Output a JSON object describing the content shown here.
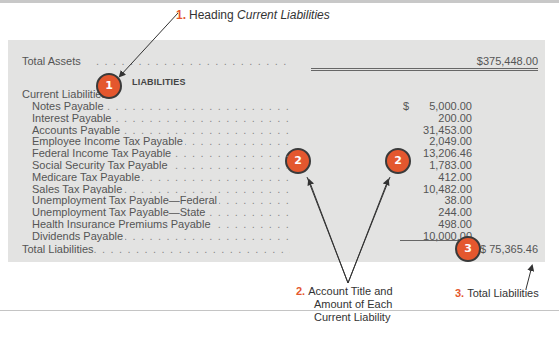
{
  "callouts": {
    "c1": {
      "num": "1.",
      "text": "Heading ",
      "italic": "Current Liabilities"
    },
    "c2": {
      "num": "2.",
      "lines": [
        "Account Title and",
        "Amount of Each",
        "Current Liability"
      ]
    },
    "c3": {
      "num": "3.",
      "text": "Total Liabilities"
    }
  },
  "badges": {
    "b1": "1",
    "b2": "2",
    "b3": "3"
  },
  "colors": {
    "accent": "#e4572e",
    "panel": "#e3e3e2"
  },
  "statement": {
    "total_assets_label": "Total Assets",
    "total_assets_value": "$375,448.00",
    "section_heading": "LIABILITIES",
    "subheading": "Current Liabilities:",
    "items": [
      {
        "label": "Notes Payable",
        "amount": "5,000.00",
        "currency": "$"
      },
      {
        "label": "Interest Payable",
        "amount": "200.00"
      },
      {
        "label": "Accounts Payable",
        "amount": "31,453.00"
      },
      {
        "label": "Employee Income Tax Payable",
        "amount": "2,049.00"
      },
      {
        "label": "Federal Income Tax Payable",
        "amount": "13,206.46"
      },
      {
        "label": "Social Security Tax Payable",
        "amount": "1,783.00"
      },
      {
        "label": "Medicare Tax Payable",
        "amount": "412.00"
      },
      {
        "label": "Sales Tax Payable",
        "amount": "10,482.00"
      },
      {
        "label": "Unemployment Tax Payable—Federal",
        "amount": "38.00"
      },
      {
        "label": "Unemployment Tax Payable—State",
        "amount": "244.00"
      },
      {
        "label": "Health Insurance Premiums Payable",
        "amount": "498.00"
      },
      {
        "label": "Dividends Payable",
        "amount": "10,000.00"
      }
    ],
    "total_liabilities_label": "Total Liabilities",
    "total_liabilities_value": "$ 75,365.46"
  }
}
